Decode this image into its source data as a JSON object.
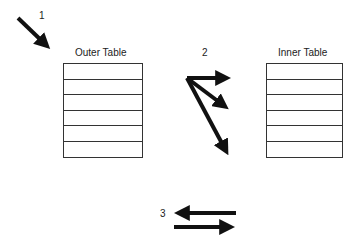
{
  "diagram": {
    "step_labels": [
      "1",
      "2",
      "3"
    ],
    "outer_table": {
      "title": "Outer Table",
      "rows": 6
    },
    "inner_table": {
      "title": "Inner Table",
      "rows": 6
    },
    "arrows": {
      "step1": {
        "description": "single arrow pointing into outer table"
      },
      "step2": {
        "description": "fan of three arrows from one origin toward inner table rows"
      },
      "step3": {
        "description": "pair of opposing arrows (left and right)"
      }
    },
    "colors": {
      "ink": "#111111",
      "line": "#333333",
      "background": "#ffffff"
    }
  }
}
